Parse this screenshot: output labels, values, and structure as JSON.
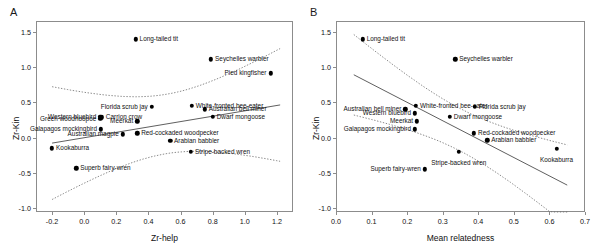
{
  "figure": {
    "panels": [
      {
        "letter": "A",
        "chart_data": {
          "type": "scatter",
          "title": "",
          "xlabel": "Zr-help",
          "ylabel": "Zr-Kin",
          "xlim": [
            -0.3,
            1.3
          ],
          "ylim": [
            -1.05,
            1.65
          ],
          "xticks": [
            -0.2,
            0.0,
            0.2,
            0.4,
            0.6,
            0.8,
            1.0,
            1.2
          ],
          "xticklabels": [
            "-0.2",
            "0.0",
            "0.2",
            "0.4",
            "0.6",
            "0.8",
            "1.0",
            "1.2"
          ],
          "yticks": [
            -1.0,
            -0.5,
            0.0,
            0.5,
            1.0,
            1.5
          ],
          "yticklabels": [
            "-1.0",
            "-0.5",
            "0.0",
            "0.5",
            "1.0",
            "1.5"
          ],
          "grid": false,
          "legend": "none",
          "regression": {
            "slope": 0.38,
            "intercept": 0.0,
            "x_start": -0.2,
            "x_end": 1.22,
            "style": "solid"
          },
          "confidence_band": {
            "style": "dotted",
            "label": "95% confidence interval"
          },
          "points": [
            {
              "label": "Long-tailed tit",
              "x": 0.32,
              "y": 1.39,
              "label_side": "right"
            },
            {
              "label": "Seychelles warbler",
              "x": 0.79,
              "y": 1.11,
              "label_side": "right"
            },
            {
              "label": "Pied kingfisher",
              "x": 1.16,
              "y": 0.91,
              "label_side": "left"
            },
            {
              "label": "Florida scrub jay",
              "x": 0.42,
              "y": 0.44,
              "label_side": "left"
            },
            {
              "label": "White-fronted bee-eater",
              "x": 0.67,
              "y": 0.45,
              "label_side": "right"
            },
            {
              "label": "Australian bell miner",
              "x": 0.75,
              "y": 0.4,
              "label_side": "right"
            },
            {
              "label": "Dwarf mongoose",
              "x": 0.8,
              "y": 0.3,
              "label_side": "right"
            },
            {
              "label": "Western bluebird",
              "x": 0.1,
              "y": 0.3,
              "label_side": "left"
            },
            {
              "label": "Carrion crow",
              "x": 0.11,
              "y": 0.29,
              "label_side": "right"
            },
            {
              "label": "Green woodhoopoe",
              "x": 0.1,
              "y": 0.27,
              "label_side": "left"
            },
            {
              "label": "Meerkat",
              "x": 0.33,
              "y": 0.23,
              "label_side": "left"
            },
            {
              "label": "Galapagos mockingbird",
              "x": 0.105,
              "y": 0.12,
              "label_side": "left"
            },
            {
              "label": "Australian magpie",
              "x": 0.24,
              "y": 0.05,
              "label_side": "left"
            },
            {
              "label": "Red-cockaded woodpecker",
              "x": 0.33,
              "y": 0.06,
              "label_side": "right"
            },
            {
              "label": "Arabian babbler",
              "x": 0.535,
              "y": -0.04,
              "label_side": "right"
            },
            {
              "label": "Kookaburra",
              "x": -0.2,
              "y": -0.15,
              "label_side": "right"
            },
            {
              "label": "Stripe-backed wren",
              "x": 0.665,
              "y": -0.2,
              "label_side": "right"
            },
            {
              "label": "Superb fairy-wren",
              "x": -0.05,
              "y": -0.43,
              "label_side": "right"
            }
          ]
        }
      },
      {
        "letter": "B",
        "chart_data": {
          "type": "scatter",
          "title": "",
          "xlabel": "Mean relatedness",
          "ylabel": "Zr-Kin",
          "xlim": [
            0.0,
            0.7
          ],
          "ylim": [
            -1.05,
            1.65
          ],
          "xticks": [
            0.0,
            0.1,
            0.2,
            0.3,
            0.4,
            0.5,
            0.6,
            0.7
          ],
          "xticklabels": [
            "0.0",
            "0.1",
            "0.2",
            "0.3",
            "0.4",
            "0.5",
            "0.6",
            "0.7"
          ],
          "yticks": [
            -1.0,
            -0.5,
            0.0,
            0.5,
            1.0,
            1.5
          ],
          "yticklabels": [
            "-1.0",
            "-0.5",
            "0.0",
            "0.5",
            "1.0",
            "1.5"
          ],
          "grid": false,
          "legend": "none",
          "regression": {
            "slope": -2.6,
            "intercept": 1.02,
            "x_start": 0.05,
            "x_end": 0.65,
            "style": "solid"
          },
          "confidence_band": {
            "style": "dotted",
            "label": "95% confidence interval"
          },
          "points": [
            {
              "label": "Long-tailed tit",
              "x": 0.075,
              "y": 1.39,
              "label_side": "right"
            },
            {
              "label": "Seychelles warbler",
              "x": 0.335,
              "y": 1.11,
              "label_side": "right"
            },
            {
              "label": "White-fronted bee-eater",
              "x": 0.225,
              "y": 0.45,
              "label_side": "right"
            },
            {
              "label": "Florida scrub jay",
              "x": 0.39,
              "y": 0.44,
              "label_side": "right"
            },
            {
              "label": "Australian bell miner",
              "x": 0.195,
              "y": 0.4,
              "label_side": "left"
            },
            {
              "label": "Western bluebird",
              "x": 0.222,
              "y": 0.345,
              "label_side": "left"
            },
            {
              "label": "Dwarf mongoose",
              "x": 0.32,
              "y": 0.295,
              "label_side": "right"
            },
            {
              "label": "Meerkat",
              "x": 0.228,
              "y": 0.23,
              "label_side": "left"
            },
            {
              "label": "Galapagos mockingbird",
              "x": 0.222,
              "y": 0.12,
              "label_side": "left"
            },
            {
              "label": "Red-cockaded woodpecker",
              "x": 0.388,
              "y": 0.065,
              "label_side": "right"
            },
            {
              "label": "Arabian babbler",
              "x": 0.425,
              "y": -0.035,
              "label_side": "right"
            },
            {
              "label": "Kookaburra",
              "x": 0.62,
              "y": -0.155,
              "label_side": "below"
            },
            {
              "label": "Stripe-backed wren",
              "x": 0.345,
              "y": -0.2,
              "label_side": "below"
            },
            {
              "label": "Superb fairy-wren",
              "x": 0.25,
              "y": -0.445,
              "label_side": "left"
            }
          ]
        }
      }
    ]
  }
}
